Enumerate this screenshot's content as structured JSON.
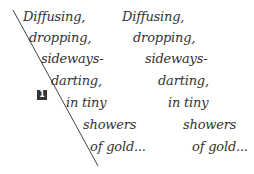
{
  "figure": {
    "marker_number": "1",
    "left_column": [
      {
        "text": "Diffusing,",
        "x": 23,
        "y": 9
      },
      {
        "text": "dropping,",
        "x": 29,
        "y": 30
      },
      {
        "text": "sideways-",
        "x": 41,
        "y": 51
      },
      {
        "text": "darting,",
        "x": 51,
        "y": 73
      },
      {
        "text": "in tiny",
        "x": 66,
        "y": 95
      },
      {
        "text": "showers",
        "x": 83,
        "y": 117
      },
      {
        "text": "of gold...",
        "x": 90,
        "y": 139
      }
    ],
    "right_column": [
      {
        "text": "Diffusing,",
        "x": 122,
        "y": 9
      },
      {
        "text": "dropping,",
        "x": 133,
        "y": 30
      },
      {
        "text": "sideways-",
        "x": 145,
        "y": 51
      },
      {
        "text": "darting,",
        "x": 158,
        "y": 73
      },
      {
        "text": "in tiny",
        "x": 168,
        "y": 95
      },
      {
        "text": "showers",
        "x": 183,
        "y": 117
      },
      {
        "text": "of gold...",
        "x": 192,
        "y": 139
      }
    ],
    "colors": {
      "text": "#333333",
      "line": "#444444",
      "background": "#ffffff"
    }
  }
}
